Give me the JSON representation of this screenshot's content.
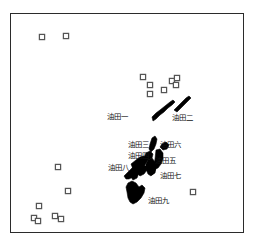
{
  "figure": {
    "type": "map",
    "background_color": "#ffffff",
    "frame": {
      "x": 10,
      "y": 13,
      "width": 234,
      "height": 220,
      "stroke_color": "#2b2b2b",
      "stroke_width": 1.3
    },
    "polygon_fill_color": "#000000",
    "marker_stroke_color": "#555555",
    "marker_fill_color": "#ffffff",
    "label_color": "#111111"
  },
  "oil_fields": [
    {
      "id": "youtian-1",
      "label": "油田一",
      "label_x": 107,
      "label_y": 113,
      "shape": "M 152 117 L 156 113 L 160 110 L 165 106 L 170 102 L 173 100 L 175 102 L 172 105 L 168 108 L 164 112 L 160 115 L 156 119 L 153 121 Z"
    },
    {
      "id": "youtian-2",
      "label": "油田二",
      "label_x": 172,
      "label_y": 114,
      "shape": "M 174 110 L 178 106 L 182 102 L 186 98 L 189 96 L 191 98 L 188 101 L 184 105 L 180 109 L 177 112 Z"
    },
    {
      "id": "youtian-3",
      "label": "油田三",
      "label_x": 128,
      "label_y": 141,
      "shape": "M 152 138 L 155 136 L 157 139 L 156 144 L 154 149 L 151 152 L 149 149 L 150 144 Z"
    },
    {
      "id": "youtian-4",
      "label": "油田四",
      "label_x": 128,
      "label_y": 152,
      "shape": "M 146 153 L 150 151 L 153 154 L 152 158 L 148 160 L 144 158 Z"
    },
    {
      "id": "youtian-5",
      "label": "油田五",
      "label_x": 155,
      "label_y": 157,
      "shape": "M 156 150 L 160 149 L 163 153 L 163 159 L 161 164 L 158 168 L 155 169 L 154 165 L 155 159 Z"
    },
    {
      "id": "youtian-6",
      "label": "油田六",
      "label_x": 160,
      "label_y": 141,
      "shape": "M 162 144 L 166 142 L 169 145 L 167 149 L 163 150 L 160 147 Z"
    },
    {
      "id": "youtian-7",
      "label": "油田七",
      "label_x": 160,
      "label_y": 172,
      "shape": "M 148 160 L 152 158 L 155 162 L 156 168 L 154 173 L 151 176 L 148 174 L 146 169 L 146 164 Z"
    },
    {
      "id": "youtian-8",
      "label": "油田八",
      "label_x": 108,
      "label_y": 164,
      "shape": "M 124 176 L 129 171 L 134 166 L 138 161 L 142 157 L 146 156 L 148 160 L 145 165 L 141 170 L 137 174 L 133 177 L 129 179 L 126 179 Z"
    },
    {
      "id": "youtian-9",
      "label": "油田九",
      "label_x": 148,
      "label_y": 197,
      "shape": "M 128 183 L 132 181 L 136 183 L 139 187 L 142 185 L 145 188 L 144 193 L 141 198 L 137 202 L 133 204 L 130 202 L 128 198 L 127 192 L 126 187 Z"
    }
  ],
  "polygon_extra": [
    {
      "id": "cluster-blob-a",
      "shape": "M 131 164 L 136 160 L 140 157 L 144 156 L 145 159 L 141 163 L 137 167 L 133 169 Z"
    },
    {
      "id": "cluster-blob-b",
      "shape": "M 138 168 L 142 165 L 146 166 L 147 170 L 144 174 L 140 176 L 137 173 Z"
    },
    {
      "id": "cluster-blob-c",
      "shape": "M 133 172 L 137 170 L 139 173 L 137 178 L 133 180 L 131 177 Z"
    },
    {
      "id": "cluster-blob-d",
      "shape": "M 151 166 L 154 164 L 156 168 L 155 173 L 152 175 L 150 171 Z"
    }
  ],
  "markers": [
    {
      "id": "marker-1",
      "x": 42,
      "y": 37
    },
    {
      "id": "marker-2",
      "x": 66,
      "y": 36
    },
    {
      "id": "marker-3",
      "x": 143,
      "y": 77
    },
    {
      "id": "marker-4",
      "x": 150,
      "y": 85
    },
    {
      "id": "marker-5",
      "x": 150,
      "y": 94
    },
    {
      "id": "marker-6",
      "x": 164,
      "y": 90
    },
    {
      "id": "marker-7",
      "x": 172,
      "y": 81
    },
    {
      "id": "marker-8",
      "x": 177,
      "y": 78
    },
    {
      "id": "marker-9",
      "x": 176,
      "y": 85
    },
    {
      "id": "marker-10",
      "x": 58,
      "y": 167
    },
    {
      "id": "marker-11",
      "x": 68,
      "y": 191
    },
    {
      "id": "marker-12",
      "x": 193,
      "y": 192
    },
    {
      "id": "marker-13",
      "x": 39,
      "y": 206
    },
    {
      "id": "marker-14",
      "x": 55,
      "y": 216
    },
    {
      "id": "marker-15",
      "x": 61,
      "y": 219
    },
    {
      "id": "marker-16",
      "x": 34,
      "y": 218
    },
    {
      "id": "marker-17",
      "x": 38,
      "y": 221
    }
  ]
}
